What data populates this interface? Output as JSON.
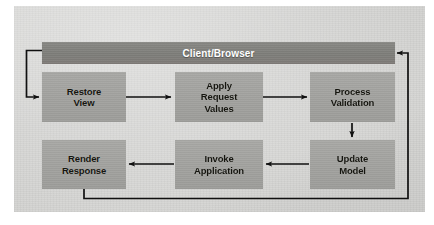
{
  "diagram": {
    "type": "flowchart",
    "colors": {
      "page_background": "#d4d4d2",
      "box_fill": "#a5a5a2",
      "bar_fill": "#828280",
      "box_text": "#15150f",
      "bar_text": "#ffffff",
      "connector": "#101010"
    },
    "client_bar": {
      "label": "Client/Browser"
    },
    "nodes": [
      {
        "id": "restore-view",
        "label": "Restore\nView"
      },
      {
        "id": "apply-request-values",
        "label": "Apply\nRequest\nValues"
      },
      {
        "id": "process-validation",
        "label": "Process\nValidation"
      },
      {
        "id": "update-model",
        "label": "Update\nModel"
      },
      {
        "id": "invoke-application",
        "label": "Invoke\nApplication"
      },
      {
        "id": "render-response",
        "label": "Render\nResponse"
      }
    ],
    "edges": [
      {
        "from": "client-bar",
        "to": "restore-view",
        "direction": "down-right"
      },
      {
        "from": "restore-view",
        "to": "apply-request-values",
        "direction": "right"
      },
      {
        "from": "apply-request-values",
        "to": "process-validation",
        "direction": "right"
      },
      {
        "from": "process-validation",
        "to": "update-model",
        "direction": "down"
      },
      {
        "from": "update-model",
        "to": "invoke-application",
        "direction": "left"
      },
      {
        "from": "invoke-application",
        "to": "render-response",
        "direction": "left"
      },
      {
        "from": "render-response",
        "to": "client-bar",
        "direction": "down-right-up"
      }
    ]
  }
}
